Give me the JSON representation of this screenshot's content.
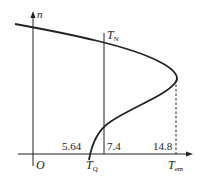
{
  "diagram": {
    "type": "motor torque-speed characteristic",
    "axes": {
      "y_label": "n",
      "x_label_main": "T",
      "x_label_sub": "em",
      "origin_label": "O"
    },
    "labels": {
      "tn_main": "T",
      "tn_sub": "N",
      "tq_main": "T",
      "tq_sub": "Q"
    },
    "values": {
      "tq_value": "5.64",
      "tn_value": "7.4",
      "tmax_value": "14.8"
    },
    "colors": {
      "line": "#222222",
      "background": "#ffffff"
    }
  }
}
